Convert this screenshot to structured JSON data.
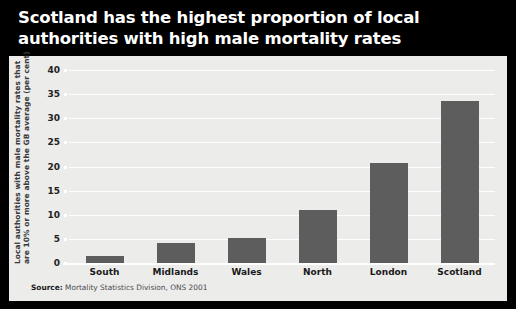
{
  "title": "Scotland has the highest proportion of local\nauthorities with high male mortality rates",
  "source_prefix": "Source:",
  "source_text": " Mortality Statistics Division, ONS 2001",
  "colors": {
    "background": "#000000",
    "title_text": "#ffffff",
    "plot_background": "#ececeb",
    "bar": "#5d5d5d",
    "gridline": "#ffffff",
    "axis_text": "#222222"
  },
  "chart_data": {
    "type": "bar",
    "title": "Scotland has the highest proportion of local authorities with high male mortality rates",
    "categories": [
      "South",
      "Midlands",
      "Wales",
      "North",
      "London",
      "Scotland"
    ],
    "values": [
      1.5,
      4.1,
      5.1,
      11.0,
      20.8,
      33.5
    ],
    "xlabel": "",
    "ylabel": "Local authorities with male mortality rates that are 10% or more above the GB average (per cent)",
    "ylabel_line1": "Local authorities with male mortality rates that",
    "ylabel_line2": "are 10% or more above the GB average (per cent)",
    "ylim": [
      0,
      40
    ],
    "yticks": [
      0,
      5,
      10,
      15,
      20,
      25,
      30,
      35,
      40
    ],
    "ytick_labels": [
      "0",
      "5",
      "10",
      "15",
      "20",
      "25",
      "30",
      "35",
      "40"
    ],
    "grid": true,
    "legend": "none",
    "source": "Source: Mortality Statistics Division, ONS 2001"
  }
}
